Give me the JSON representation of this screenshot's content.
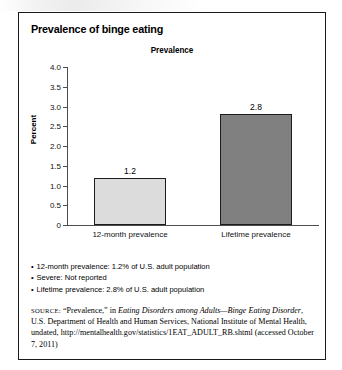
{
  "figure": {
    "title": "Prevalence of binge eating"
  },
  "chart_data": {
    "type": "bar",
    "title": "Prevalence",
    "xlabel": "",
    "ylabel": "Percent",
    "categories": [
      "12-month prevalence",
      "Lifetime prevalence"
    ],
    "values": [
      1.2,
      2.8
    ],
    "value_labels": [
      "1.2",
      "2.8"
    ],
    "ylim": [
      0,
      4.0
    ],
    "ytick_step": 0.5,
    "ytick_labels": [
      "4.0",
      "3.5",
      "3.0",
      "2.5",
      "2.0",
      "1.5",
      "1.0",
      "0.5",
      "0"
    ],
    "grid": false,
    "legend": false,
    "bar_colors": [
      "#dcdcdc",
      "#808080"
    ],
    "bar_border_color": "#1c1c1c",
    "axis_color": "#4d4d4d"
  },
  "bullets": [
    "12-month prevalence: 1.2% of U.S. adult population",
    "Severe: Not reported",
    "Lifetime prevalence: 2.8% of U.S. adult population"
  ],
  "bullet_marker": "•",
  "source": {
    "keyword": "SOURCE:",
    "part1": " “Prevalence,” in ",
    "italic1": "Eating Disorders among Adults—Binge Eating Disorder",
    "part2": ", U.S. Department of Health and Human Services, National Institute of Mental Health, undated, http://mentalhealth.gov/statistics/1EAT_ADULT_RB.shtml (accessed October 7, 2011)"
  }
}
